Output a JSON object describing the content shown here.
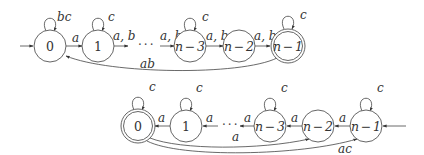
{
  "automata": [
    {
      "id": "top",
      "states": [
        {
          "id": "0",
          "label": "0",
          "accepting": false,
          "initial": true
        },
        {
          "id": "1",
          "label": "1",
          "accepting": false
        },
        {
          "id": "n-3",
          "label": "n − 3",
          "accepting": false
        },
        {
          "id": "n-2",
          "label": "n − 2",
          "accepting": false
        },
        {
          "id": "n-1",
          "label": "n − 1",
          "accepting": true
        }
      ],
      "ellipsis": "···",
      "self_loops": [
        {
          "state": "0",
          "label": "bc"
        },
        {
          "state": "1",
          "label": "c"
        },
        {
          "state": "n-3",
          "label": "c"
        },
        {
          "state": "n-1",
          "label": "c"
        }
      ],
      "transitions": [
        {
          "from": "0",
          "to": "1",
          "label": "a"
        },
        {
          "from": "1",
          "to": "...",
          "label": "a, b"
        },
        {
          "from": "...",
          "to": "n-3",
          "label": "a, b"
        },
        {
          "from": "n-3",
          "to": "n-2",
          "label": "a, b"
        },
        {
          "from": "n-2",
          "to": "n-1",
          "label": "a, b"
        },
        {
          "from": "n-1",
          "to": "0",
          "label": "ab"
        }
      ]
    },
    {
      "id": "bottom",
      "states": [
        {
          "id": "0",
          "label": "0",
          "accepting": true
        },
        {
          "id": "1",
          "label": "1",
          "accepting": false
        },
        {
          "id": "n-3",
          "label": "n − 3",
          "accepting": false
        },
        {
          "id": "n-2",
          "label": "n − 2",
          "accepting": false
        },
        {
          "id": "n-1",
          "label": "n − 1",
          "accepting": false,
          "initial": true
        }
      ],
      "ellipsis": "···",
      "self_loops": [
        {
          "state": "0",
          "label": "c"
        },
        {
          "state": "1",
          "label": "c"
        },
        {
          "state": "n-3",
          "label": "c"
        },
        {
          "state": "n-1",
          "label": "c"
        }
      ],
      "transitions": [
        {
          "from": "1",
          "to": "0",
          "label": "a"
        },
        {
          "from": "...",
          "to": "1",
          "label": "a"
        },
        {
          "from": "n-3",
          "to": "...",
          "label": "a"
        },
        {
          "from": "n-2",
          "to": "n-3",
          "label": "a"
        },
        {
          "from": "n-1",
          "to": "n-2",
          "label": "a"
        },
        {
          "from": "0",
          "to": "n-2",
          "label": "a"
        },
        {
          "from": "0",
          "to": "n-1",
          "label": "ac"
        }
      ]
    }
  ]
}
